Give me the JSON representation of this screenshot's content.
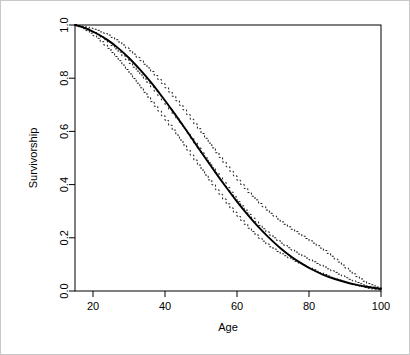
{
  "figure": {
    "width": 410,
    "height": 355,
    "background_color": "#ffffff",
    "border_color": "#c8c8c8",
    "foreground_color": "#000000"
  },
  "chart_data": {
    "type": "line",
    "title": "",
    "subtitle": "",
    "xlabel": "Age",
    "ylabel": "Survivorship",
    "xlim": [
      15,
      100
    ],
    "ylim": [
      0.0,
      1.0
    ],
    "grid": false,
    "legend": null,
    "legend_position": "none",
    "xticks": [
      20,
      40,
      60,
      80,
      100
    ],
    "xtick_labels": [
      "20",
      "40",
      "60",
      "80",
      "100"
    ],
    "yticks": [
      0.0,
      0.2,
      0.4,
      0.6,
      0.8,
      1.0
    ],
    "ytick_labels": [
      "0.0",
      "0.2",
      "0.4",
      "0.6",
      "0.8",
      "1.0"
    ],
    "x": [
      15,
      18,
      21,
      24,
      27,
      30,
      33,
      36,
      39,
      42,
      45,
      48,
      51,
      54,
      57,
      60,
      63,
      66,
      69,
      72,
      75,
      78,
      81,
      84,
      87,
      90,
      93,
      96,
      100
    ],
    "series": [
      {
        "name": "Fitted survivorship model",
        "style": "solid",
        "color": "#000000",
        "values": [
          1.0,
          0.987,
          0.968,
          0.944,
          0.913,
          0.876,
          0.833,
          0.786,
          0.734,
          0.679,
          0.622,
          0.563,
          0.504,
          0.446,
          0.39,
          0.336,
          0.286,
          0.24,
          0.199,
          0.162,
          0.13,
          0.103,
          0.08,
          0.061,
          0.046,
          0.034,
          0.024,
          0.016,
          0.008
        ]
      },
      {
        "name": "Empirical survivorship estimate",
        "style": "dashed-step",
        "color": "#000000",
        "values": [
          1.0,
          0.986,
          0.965,
          0.935,
          0.898,
          0.856,
          0.812,
          0.767,
          0.718,
          0.666,
          0.612,
          0.556,
          0.5,
          0.444,
          0.389,
          0.336,
          0.288,
          0.246,
          0.21,
          0.18,
          0.154,
          0.131,
          0.11,
          0.09,
          0.07,
          0.05,
          0.032,
          0.018,
          0.006
        ]
      },
      {
        "name": "Upper confidence band",
        "style": "dashed-step",
        "color": "#000000",
        "values": [
          1.0,
          0.992,
          0.98,
          0.962,
          0.936,
          0.903,
          0.866,
          0.825,
          0.78,
          0.732,
          0.681,
          0.628,
          0.574,
          0.52,
          0.467,
          0.416,
          0.37,
          0.329,
          0.292,
          0.26,
          0.232,
          0.206,
          0.18,
          0.152,
          0.12,
          0.086,
          0.054,
          0.028,
          0.01
        ]
      },
      {
        "name": "Lower confidence band",
        "style": "dashed-step",
        "color": "#000000",
        "values": [
          1.0,
          0.979,
          0.95,
          0.912,
          0.866,
          0.816,
          0.764,
          0.712,
          0.659,
          0.605,
          0.549,
          0.492,
          0.436,
          0.381,
          0.328,
          0.28,
          0.236,
          0.198,
          0.166,
          0.14,
          0.118,
          0.098,
          0.08,
          0.062,
          0.046,
          0.032,
          0.02,
          0.01,
          0.003
        ]
      }
    ]
  }
}
